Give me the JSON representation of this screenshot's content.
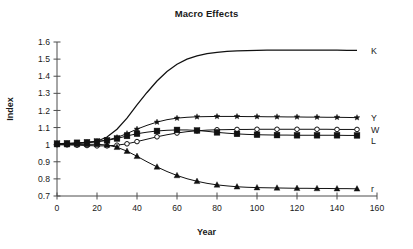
{
  "chart_data": {
    "type": "line",
    "title": "Macro Effects",
    "xlabel": "Year",
    "ylabel": "Index",
    "xlim": [
      0,
      160
    ],
    "ylim": [
      0.7,
      1.6
    ],
    "xticks": [
      0,
      20,
      40,
      60,
      80,
      100,
      120,
      140,
      160
    ],
    "xtick_labels": [
      "0",
      "20",
      "40",
      "60",
      "80",
      "100",
      "120",
      "140",
      "160"
    ],
    "yticks": [
      0.7,
      0.8,
      0.9,
      1.0,
      1.1,
      1.2,
      1.3,
      1.4,
      1.5,
      1.6
    ],
    "ytick_labels": [
      "0.7",
      "0.8",
      "0.9",
      "1",
      "1.1",
      "1.2",
      "1.3",
      "1.4",
      "1.5",
      "1.6"
    ],
    "grid": false,
    "legend_position": "right-inline-labels",
    "x": [
      0,
      5,
      10,
      15,
      20,
      25,
      30,
      35,
      40,
      45,
      50,
      55,
      60,
      65,
      70,
      75,
      80,
      85,
      90,
      95,
      100,
      105,
      110,
      115,
      120,
      125,
      130,
      135,
      140,
      145,
      150
    ],
    "series": [
      {
        "name": "K",
        "label": "K",
        "marker": "none",
        "line": "solid",
        "values": [
          1.005,
          1.006,
          1.008,
          1.012,
          1.02,
          1.045,
          1.09,
          1.155,
          1.232,
          1.305,
          1.372,
          1.428,
          1.47,
          1.5,
          1.519,
          1.532,
          1.54,
          1.545,
          1.548,
          1.55,
          1.551,
          1.552,
          1.552,
          1.552,
          1.552,
          1.552,
          1.552,
          1.552,
          1.552,
          1.551,
          1.551
        ]
      },
      {
        "name": "Y",
        "label": "Y",
        "marker": "star",
        "line": "solid",
        "values": [
          1.005,
          1.006,
          1.008,
          1.012,
          1.018,
          1.027,
          1.042,
          1.065,
          1.091,
          1.113,
          1.132,
          1.146,
          1.155,
          1.16,
          1.163,
          1.164,
          1.165,
          1.165,
          1.165,
          1.164,
          1.164,
          1.163,
          1.163,
          1.162,
          1.162,
          1.161,
          1.161,
          1.16,
          1.16,
          1.159,
          1.158
        ]
      },
      {
        "name": "W",
        "label": "W",
        "marker": "open-circle",
        "line": "solid",
        "values": [
          1.0,
          0.999,
          0.997,
          0.995,
          0.993,
          0.993,
          0.997,
          1.005,
          1.018,
          1.032,
          1.046,
          1.058,
          1.068,
          1.076,
          1.081,
          1.085,
          1.087,
          1.088,
          1.089,
          1.089,
          1.09,
          1.09,
          1.09,
          1.09,
          1.09,
          1.09,
          1.09,
          1.09,
          1.089,
          1.089,
          1.089
        ]
      },
      {
        "name": "L",
        "label": "L",
        "marker": "filled-square",
        "line": "solid",
        "values": [
          1.006,
          1.008,
          1.011,
          1.014,
          1.018,
          1.025,
          1.036,
          1.051,
          1.064,
          1.073,
          1.08,
          1.084,
          1.086,
          1.086,
          1.083,
          1.078,
          1.072,
          1.067,
          1.063,
          1.06,
          1.058,
          1.057,
          1.056,
          1.056,
          1.055,
          1.055,
          1.055,
          1.055,
          1.055,
          1.054,
          1.054
        ]
      },
      {
        "name": "r",
        "label": "r",
        "marker": "filled-triangle",
        "line": "solid",
        "values": [
          1.0,
          1.0,
          1.001,
          1.002,
          1.002,
          0.998,
          0.985,
          0.962,
          0.932,
          0.9,
          0.87,
          0.843,
          0.82,
          0.801,
          0.786,
          0.774,
          0.765,
          0.759,
          0.754,
          0.751,
          0.749,
          0.748,
          0.747,
          0.746,
          0.745,
          0.745,
          0.744,
          0.744,
          0.743,
          0.743,
          0.742
        ]
      }
    ]
  }
}
